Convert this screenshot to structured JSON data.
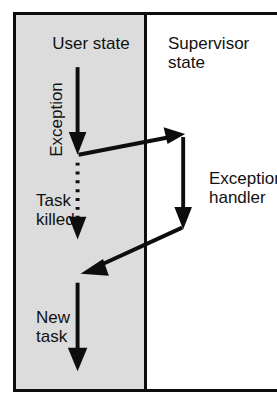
{
  "diagram": {
    "title_left": "User state",
    "title_right": "Supervisor\nstate",
    "labels": {
      "exception": "Exception",
      "task_killed": "Task\nkilled",
      "new_task": "New\ntask",
      "exception_handler": "Exception\nhandler"
    },
    "colors": {
      "panel_shaded": "#dcdcdc",
      "panel_plain": "#ffffff",
      "stroke": "#0d0d0d",
      "text": "#111111"
    },
    "flow": [
      {
        "name": "user-task-running",
        "style": "solid",
        "direction": "down",
        "region": "user state"
      },
      {
        "name": "exception-raised",
        "style": "solid",
        "direction": "up-right",
        "region": "user state to supervisor state"
      },
      {
        "name": "exception-handler-running",
        "style": "solid",
        "direction": "down",
        "region": "supervisor state"
      },
      {
        "name": "task-killed",
        "style": "dotted",
        "direction": "down",
        "region": "user state"
      },
      {
        "name": "return-to-user",
        "style": "solid",
        "direction": "down-left",
        "region": "supervisor state to user state"
      },
      {
        "name": "new-task-running",
        "style": "solid",
        "direction": "down",
        "region": "user state"
      }
    ]
  }
}
